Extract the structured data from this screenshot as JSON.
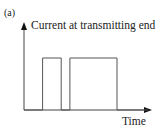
{
  "panel_label": "(a)",
  "chart_data": {
    "type": "line",
    "title": "",
    "ylabel": "Current at transmitting end",
    "xlabel": "Time",
    "grid": false,
    "pulses": [
      {
        "start": 0.15,
        "end": 0.3,
        "level": 1
      },
      {
        "start": 0.37,
        "end": 0.75,
        "level": 1
      }
    ],
    "x": [
      0,
      0.15,
      0.15,
      0.3,
      0.3,
      0.37,
      0.37,
      0.75,
      0.75,
      1.0
    ],
    "y": [
      0,
      0,
      1,
      1,
      0,
      0,
      1,
      1,
      0,
      0
    ],
    "xlim": [
      0,
      1
    ],
    "ylim": [
      0,
      1.3
    ]
  },
  "colors": {
    "line": "#555555",
    "axis": "#333333"
  }
}
